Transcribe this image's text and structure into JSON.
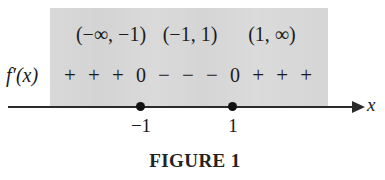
{
  "figure": {
    "caption": "FIGURE 1",
    "function_label": "f′(x)",
    "axis_name": "x",
    "shade_color": "#d4d4d4",
    "ink_color": "#1b1b1b"
  },
  "intervals": [
    {
      "name": "interval-left",
      "label": "(−∞, −1)"
    },
    {
      "name": "interval-middle",
      "label": "(−1, 1)"
    },
    {
      "name": "interval-right",
      "label": "(1, ∞)"
    }
  ],
  "signs": [
    {
      "symbol": "+",
      "kind": "plus"
    },
    {
      "symbol": "+",
      "kind": "plus"
    },
    {
      "symbol": "+",
      "kind": "plus"
    },
    {
      "symbol": "0",
      "kind": "zero"
    },
    {
      "symbol": "−",
      "kind": "minus"
    },
    {
      "symbol": "−",
      "kind": "minus"
    },
    {
      "symbol": "−",
      "kind": "minus"
    },
    {
      "symbol": "0",
      "kind": "zero"
    },
    {
      "symbol": "+",
      "kind": "plus"
    },
    {
      "symbol": "+",
      "kind": "plus"
    },
    {
      "symbol": "+",
      "kind": "plus"
    }
  ],
  "axis": {
    "ticks": [
      {
        "name": "tick-neg1",
        "label": "−1",
        "value": -1
      },
      {
        "name": "tick-pos1",
        "label": "1",
        "value": 1
      }
    ]
  },
  "chart_data": {
    "type": "table",
    "title": "FIGURE 1",
    "xlabel": "x",
    "ylabel": "f′(x)",
    "categories": [
      "(−∞, −1)",
      "(−1, 1)",
      "(1, ∞)"
    ],
    "values": [
      "+",
      "−",
      "+"
    ],
    "critical_points": [
      -1,
      1
    ],
    "sign_sequence": [
      "+",
      "+",
      "+",
      "0",
      "−",
      "−",
      "−",
      "0",
      "+",
      "+",
      "+"
    ],
    "grid": false,
    "legend": "none"
  }
}
